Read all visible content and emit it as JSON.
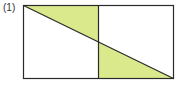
{
  "figure": {
    "label": "(1)",
    "fill_color": "#d9e98c",
    "stroke_color": "#2a2a2a",
    "rect": {
      "x": 23,
      "y": 5,
      "width": 151,
      "height": 74
    },
    "divider_x": 98.5
  }
}
